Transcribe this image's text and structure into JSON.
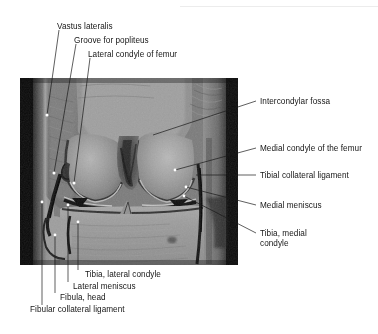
{
  "figure": {
    "name": "coronal-knee-mri-labeled",
    "modality": "MRI",
    "view": "coronal",
    "region": "knee"
  },
  "image_panel": {
    "x": 20,
    "y": 78,
    "width": 218,
    "height": 187
  },
  "labels_top": [
    {
      "id": "vastus-lateralis",
      "text": "Vastus lateralis",
      "x": 57,
      "y": 24
    },
    {
      "id": "groove-for-popliteus",
      "text": "Groove for popliteus",
      "x": 74,
      "y": 38
    },
    {
      "id": "lateral-condyle-of-femur",
      "text": "Lateral condyle of femur",
      "x": 88,
      "y": 52
    }
  ],
  "labels_right": [
    {
      "id": "intercondylar-fossa",
      "text": "Intercondylar fossa",
      "x": 258,
      "y": 104
    },
    {
      "id": "medial-condyle-of-the-femur",
      "text": "Medial condyle of the femur",
      "x": 258,
      "y": 151
    },
    {
      "id": "tibial-collateral-ligament",
      "text": "Tibial collateral ligament",
      "x": 258,
      "y": 178
    },
    {
      "id": "medial-meniscus",
      "text": "Medial meniscus",
      "x": 258,
      "y": 208
    },
    {
      "id": "tibia-medial-condyle",
      "text": "Tibia, medial condyle",
      "x": 258,
      "y": 236
    }
  ],
  "labels_bottom": [
    {
      "id": "tibia-lateral-condyle",
      "text": "Tibia, lateral condyle",
      "x": 69,
      "y": 274
    },
    {
      "id": "lateral-meniscus",
      "text": "Lateral meniscus",
      "x": 58,
      "y": 286
    },
    {
      "id": "fibula-head",
      "text": "Fibula, head",
      "x": 46,
      "y": 297
    },
    {
      "id": "fibular-collateral-ligament",
      "text": "Fibular collateral ligament",
      "x": 30,
      "y": 309
    }
  ],
  "leader_lines": [
    {
      "id": "leader-vastus-lateralis",
      "x1": 59,
      "y1": 30,
      "x2": 47,
      "y2": 115
    },
    {
      "id": "leader-groove-for-popliteus",
      "x1": 76,
      "y1": 44,
      "x2": 54,
      "y2": 173
    },
    {
      "id": "leader-lateral-condyle-of-femur",
      "x1": 90,
      "y1": 58,
      "x2": 74,
      "y2": 183
    },
    {
      "id": "leader-intercondylar-fossa",
      "x1": 256,
      "y1": 101,
      "x2": 153,
      "y2": 135
    },
    {
      "id": "leader-medial-condyle-of-the-femur",
      "x1": 256,
      "y1": 148,
      "x2": 175,
      "y2": 170
    },
    {
      "id": "leader-tibial-collateral-ligament",
      "x1": 256,
      "y1": 175,
      "x2": 196,
      "y2": 175
    },
    {
      "id": "leader-medial-meniscus",
      "x1": 256,
      "y1": 205,
      "x2": 186,
      "y2": 187
    },
    {
      "id": "leader-tibia-medial-condyle",
      "x1": 256,
      "y1": 233,
      "x2": 184,
      "y2": 196
    },
    {
      "id": "leader-tibia-lateral-condyle",
      "x1": 78,
      "y1": 270,
      "x2": 78,
      "y2": 222
    },
    {
      "id": "leader-lateral-meniscus",
      "x1": 68,
      "y1": 282,
      "x2": 68,
      "y2": 205
    },
    {
      "id": "leader-fibula-head",
      "x1": 55,
      "y1": 293,
      "x2": 55,
      "y2": 235
    },
    {
      "id": "leader-fibular-collateral-ligament",
      "x1": 42,
      "y1": 305,
      "x2": 42,
      "y2": 202
    }
  ],
  "colors": {
    "background": "#ffffff",
    "text": "#161616",
    "leader_line": "#1a1a1a",
    "marker_dot": "#ffffff",
    "scan_artifact": "#ececec"
  }
}
